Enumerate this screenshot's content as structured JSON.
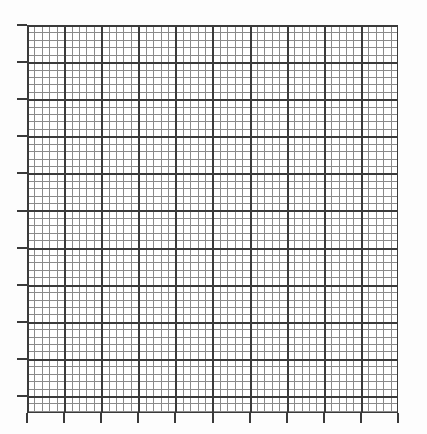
{
  "figure": {
    "kind": "graph-paper-grid",
    "title": "",
    "subtitle": "",
    "background_color": "#fdfdfd",
    "plot_background_color": "#ffffff"
  },
  "plot_area": {
    "left_px": 27,
    "top_px": 25,
    "width_px": 371,
    "height_px": 388
  },
  "grid": {
    "minor_spacing_px": 7.42,
    "major_spacing_px": 37.1,
    "minor_per_major": 5,
    "minor_color": "#8a8a8a",
    "major_color": "#3a3a3a",
    "minor_line_width_px": 1,
    "major_line_width_px": 2,
    "minor_columns": 50,
    "minor_rows": 52,
    "major_columns": 10,
    "major_rows": 10
  },
  "axes": {
    "border_color": "#3a3a3a",
    "border_width_px": 1,
    "xlabel": "",
    "ylabel": "",
    "x_tick_labels": [],
    "y_tick_labels": [],
    "tick_color": "#3a3a3a",
    "tick_length_px": 10,
    "tick_width_px": 2,
    "left_tick_count": 11,
    "bottom_tick_count": 11,
    "right_ticks": false,
    "top_ticks": false
  },
  "chart_data": {
    "type": "line",
    "title": "",
    "xlabel": "",
    "ylabel": "",
    "categories": [],
    "series": [],
    "values": [],
    "x": [],
    "xlim": [
      0,
      10
    ],
    "ylim": [
      0,
      10
    ],
    "grid": true,
    "minor_grid": true,
    "legend": null,
    "annotations": [],
    "note": "Empty graph-paper grid: no plotted data points, no tick labels, no legend."
  }
}
